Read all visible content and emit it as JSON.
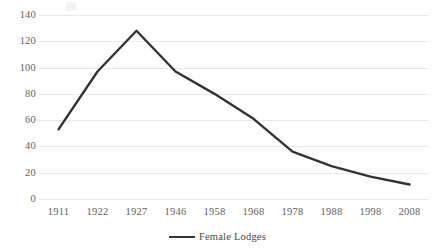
{
  "chart_data": {
    "type": "line",
    "title": "",
    "xlabel": "",
    "ylabel": "",
    "categories": [
      "1911",
      "1922",
      "1927",
      "1946",
      "1958",
      "1968",
      "1978",
      "1988",
      "1998",
      "2008"
    ],
    "series": [
      {
        "name": "Female Lodges",
        "values": [
          53,
          97,
          128,
          97,
          80,
          61,
          36,
          25,
          17,
          11
        ],
        "color": "#333333"
      }
    ],
    "ylim": [
      0,
      140
    ],
    "yticks": [
      0,
      20,
      40,
      60,
      80,
      100,
      120,
      140
    ],
    "ytick_labels": [
      "0",
      "20",
      "40",
      "60",
      "80",
      "100",
      "120",
      "140"
    ],
    "grid": true,
    "grid_color": "#e8e8e8",
    "legend": {
      "position": "bottom",
      "entries": [
        "Female Lodges"
      ]
    },
    "background": "#ffffff"
  }
}
